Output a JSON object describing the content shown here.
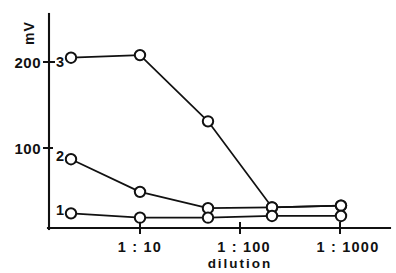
{
  "chart_data": {
    "type": "line",
    "title": "",
    "xlabel": "dilution",
    "ylabel": "mV",
    "x_tick_labels": [
      "1 : 10",
      "1 : 100",
      "1 : 1000"
    ],
    "x_tick_positions": [
      140,
      240,
      340
    ],
    "y_tick_labels": [
      "200",
      "100"
    ],
    "y_tick_values": [
      200,
      100
    ],
    "ylim": [
      0,
      240
    ],
    "grid": false,
    "legend": "inline-left-labels",
    "marker": "open-circle",
    "categories": [
      "1 : 2",
      "1 : 10",
      "1 : 40",
      "1 : 200",
      "1 : 1000"
    ],
    "x_pixels": [
      71,
      140,
      208,
      272,
      341
    ],
    "series": [
      {
        "name": "3",
        "label": "3",
        "values": [
          205,
          208,
          131,
          31,
          33
        ],
        "label_x": 60,
        "label_y": 62
      },
      {
        "name": "2",
        "label": "2",
        "values": [
          87,
          49,
          30,
          31,
          33
        ],
        "label_x": 60,
        "label_y": 156
      },
      {
        "name": "1",
        "label": "1",
        "values": [
          24,
          19,
          19,
          21,
          21
        ],
        "label_x": 60,
        "label_y": 210
      }
    ]
  },
  "axes": {
    "y_axis_x": 49,
    "y_axis_top": 14,
    "baseline_y": 228,
    "x_axis_right": 390,
    "y_200_pixel": 62,
    "y_100_pixel": 148,
    "y_zero_pixel": 228
  },
  "labels": {
    "y_title": "mV",
    "x_title": "dilution",
    "y_tick_200": "200",
    "y_tick_100": "100",
    "x_tick_1": "1 : 10",
    "x_tick_2": "1 : 100",
    "x_tick_3": "1 : 1000",
    "series_3": "3",
    "series_2": "2",
    "series_1": "1"
  },
  "colors": {
    "ink": "#111111",
    "paper": "#ffffff",
    "marker_fill": "#ffffff"
  }
}
